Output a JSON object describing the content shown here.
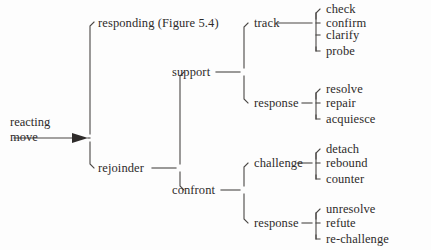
{
  "diagram": {
    "type": "tree",
    "title_text": "",
    "root": {
      "label_line1": "reacting",
      "label_line2": "move",
      "arrow": "rightwards-arrow"
    },
    "level1": [
      {
        "label": "responding (Figure 5.4)"
      },
      {
        "label": "rejoinder"
      }
    ],
    "level2": [
      {
        "label": "support"
      },
      {
        "label": "confront"
      }
    ],
    "level3": [
      {
        "label": "track"
      },
      {
        "label": "response"
      },
      {
        "label": "challenge"
      },
      {
        "label": "response"
      }
    ],
    "level4": {
      "track": [
        "check",
        "confirm",
        "clarify",
        "probe"
      ],
      "support_response": [
        "resolve",
        "repair",
        "acquiesce"
      ],
      "challenge": [
        "detach",
        "rebound",
        "counter"
      ],
      "confront_response": [
        "unresolve",
        "refute",
        "re-challenge"
      ]
    }
  },
  "colors": {
    "background": "#fdfdfd",
    "text": "#2e2b2a",
    "line": "#4a4745"
  }
}
